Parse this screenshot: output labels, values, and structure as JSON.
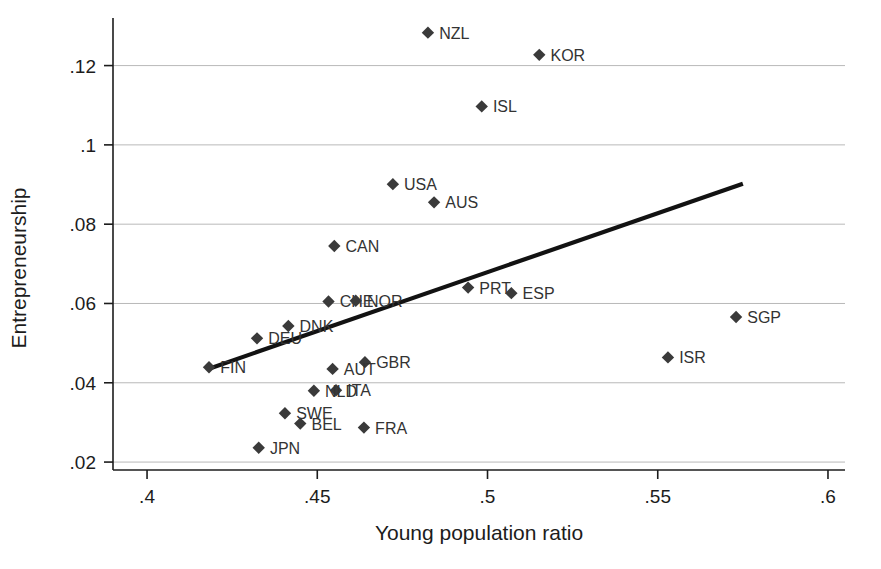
{
  "chart_data": {
    "type": "scatter",
    "title": "",
    "xlabel": "Young population ratio",
    "ylabel": "Entrepreneurship",
    "xlim": [
      0.39,
      0.605
    ],
    "ylim": [
      0.018,
      0.132
    ],
    "xticks": [
      0.4,
      0.45,
      0.5,
      0.55,
      0.6
    ],
    "xticklabels": [
      ".4",
      ".45",
      ".5",
      ".55",
      ".6"
    ],
    "yticks": [
      0.02,
      0.04,
      0.06,
      0.08,
      0.1,
      0.12
    ],
    "yticklabels": [
      ".02",
      ".04",
      ".06",
      ".08",
      ".1",
      ".12"
    ],
    "grid": "horizontal",
    "legend": "none",
    "marker_shape": "diamond",
    "marker_color": "#3a3a3a",
    "fit_line": {
      "label": "linear fit",
      "color": "#121212",
      "x_start": 0.418,
      "y_start": 0.0435,
      "x_end": 0.575,
      "y_end": 0.0902
    },
    "points": [
      {
        "code": "NZL",
        "x": 0.4825,
        "y": 0.1283,
        "label_side": "right"
      },
      {
        "code": "KOR",
        "x": 0.5152,
        "y": 0.1227,
        "label_side": "right"
      },
      {
        "code": "ISL",
        "x": 0.4983,
        "y": 0.1097,
        "label_side": "right"
      },
      {
        "code": "USA",
        "x": 0.4722,
        "y": 0.0901,
        "label_side": "right"
      },
      {
        "code": "AUS",
        "x": 0.4843,
        "y": 0.0855,
        "label_side": "right"
      },
      {
        "code": "CAN",
        "x": 0.455,
        "y": 0.0745,
        "label_side": "right"
      },
      {
        "code": "PRT",
        "x": 0.4943,
        "y": 0.064,
        "label_side": "right"
      },
      {
        "code": "ESP",
        "x": 0.507,
        "y": 0.0626,
        "label_side": "right"
      },
      {
        "code": "CHE",
        "x": 0.4533,
        "y": 0.0605,
        "label_side": "right"
      },
      {
        "code": "NOR",
        "x": 0.4613,
        "y": 0.0607,
        "label_side": "right"
      },
      {
        "code": "SGP",
        "x": 0.573,
        "y": 0.0566,
        "label_side": "right"
      },
      {
        "code": "DNK",
        "x": 0.4415,
        "y": 0.0543,
        "label_side": "right"
      },
      {
        "code": "DEU",
        "x": 0.4323,
        "y": 0.0512,
        "label_side": "right"
      },
      {
        "code": "ISR",
        "x": 0.553,
        "y": 0.0464,
        "label_side": "right"
      },
      {
        "code": "GBR",
        "x": 0.464,
        "y": 0.0452,
        "label_side": "right"
      },
      {
        "code": "AUT",
        "x": 0.4545,
        "y": 0.0435,
        "label_side": "right"
      },
      {
        "code": "FIN",
        "x": 0.4182,
        "y": 0.0439,
        "label_side": "right"
      },
      {
        "code": "ITA",
        "x": 0.4555,
        "y": 0.0381,
        "label_side": "right"
      },
      {
        "code": "NLD",
        "x": 0.449,
        "y": 0.038,
        "label_side": "right"
      },
      {
        "code": "SWE",
        "x": 0.4405,
        "y": 0.0323,
        "label_side": "right"
      },
      {
        "code": "BEL",
        "x": 0.445,
        "y": 0.0297,
        "label_side": "right"
      },
      {
        "code": "FRA",
        "x": 0.4637,
        "y": 0.0287,
        "label_side": "right"
      },
      {
        "code": "JPN",
        "x": 0.4328,
        "y": 0.0236,
        "label_side": "right"
      }
    ]
  }
}
